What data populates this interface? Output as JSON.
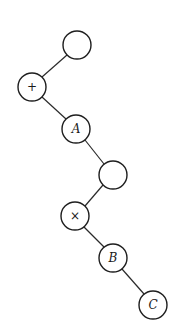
{
  "diagram": {
    "type": "binary-tree",
    "nodes": [
      {
        "id": "n1",
        "label": "",
        "cx": 77,
        "cy": 45,
        "italic": false
      },
      {
        "id": "n2",
        "label": "+",
        "cx": 32,
        "cy": 87,
        "italic": false
      },
      {
        "id": "n3",
        "label": "A",
        "cx": 76,
        "cy": 129,
        "italic": true
      },
      {
        "id": "n4",
        "label": "",
        "cx": 113,
        "cy": 175,
        "italic": false
      },
      {
        "id": "n5",
        "label": "×",
        "cx": 75,
        "cy": 216,
        "italic": false
      },
      {
        "id": "n6",
        "label": "B",
        "cx": 113,
        "cy": 258,
        "italic": true
      },
      {
        "id": "n7",
        "label": "C",
        "cx": 153,
        "cy": 305,
        "italic": true
      }
    ],
    "edges": [
      {
        "from": "n1",
        "to": "n2"
      },
      {
        "from": "n2",
        "to": "n3"
      },
      {
        "from": "n3",
        "to": "n4"
      },
      {
        "from": "n4",
        "to": "n5"
      },
      {
        "from": "n5",
        "to": "n6"
      },
      {
        "from": "n6",
        "to": "n7"
      }
    ],
    "node_radius": 14
  }
}
